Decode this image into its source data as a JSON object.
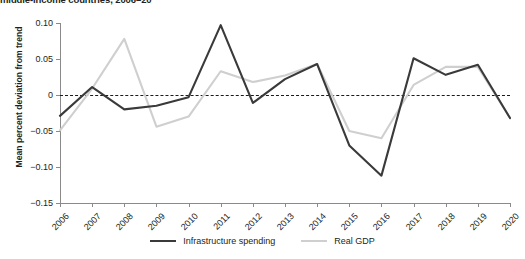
{
  "chart_data": {
    "type": "line",
    "title": "middle-income countries, 2006–20",
    "xlabel": "",
    "ylabel": "Mean percent deviation from trend",
    "x": [
      2006,
      2007,
      2008,
      2009,
      2010,
      2011,
      2012,
      2013,
      2014,
      2015,
      2016,
      2017,
      2018,
      2019,
      2020
    ],
    "categories": [
      "2006",
      "2007",
      "2008",
      "2009",
      "2010",
      "2011",
      "2012",
      "2013",
      "2014",
      "2015",
      "2016",
      "2017",
      "2018",
      "2019",
      "2020"
    ],
    "ylim": [
      -0.15,
      0.1
    ],
    "yticks": [
      0.1,
      0.05,
      0,
      -0.05,
      -0.1,
      -0.15
    ],
    "ytick_labels": [
      "0.10",
      "0.05",
      "0",
      "−0.05",
      "−0.10",
      "−0.15"
    ],
    "grid": false,
    "zero_reference_line": 0,
    "legend_position": "bottom",
    "series": [
      {
        "name": "Infrastructure spending",
        "color": "#3a3a3a",
        "values": [
          -0.029,
          0.011,
          -0.02,
          -0.015,
          -0.003,
          0.097,
          -0.011,
          0.022,
          0.043,
          -0.07,
          -0.112,
          0.051,
          0.028,
          0.042,
          -0.032
        ]
      },
      {
        "name": "Real GDP",
        "color": "#cfcfcf",
        "values": [
          -0.049,
          0.009,
          0.078,
          -0.044,
          -0.03,
          0.033,
          0.018,
          0.027,
          0.043,
          -0.05,
          -0.06,
          0.014,
          0.039,
          0.039,
          -0.032
        ]
      }
    ]
  },
  "legend": {
    "items": [
      {
        "label": "Infrastructure spending",
        "swatch": "dark-line-swatch"
      },
      {
        "label": "Real GDP",
        "swatch": "light-line-swatch"
      }
    ]
  }
}
